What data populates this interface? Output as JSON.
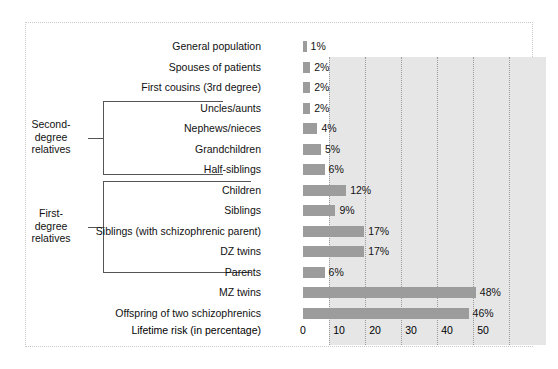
{
  "chart_data": {
    "type": "bar",
    "orientation": "horizontal",
    "title": "",
    "xlabel": "Lifetime risk (in percentage)",
    "ylabel": "",
    "xlim": [
      0,
      60
    ],
    "xticks": [
      "0",
      "10",
      "20",
      "30",
      "40",
      "50"
    ],
    "xtick_values": [
      0,
      10,
      20,
      30,
      40,
      50
    ],
    "grid": "vertical dotted gridlines",
    "legend": "none",
    "bar_color": "#9c9c9c",
    "plot_background": "#e6e6e6",
    "value_suffix": "%",
    "categories": [
      "General population",
      "Spouses of patients",
      "First cousins (3rd degree)",
      "Uncles/aunts",
      "Nephews/nieces",
      "Grandchildren",
      "Half-siblings",
      "Children",
      "Siblings",
      "Siblings (with schizophrenic parent)",
      "DZ twins",
      "Parents",
      "MZ twins",
      "Offspring of two schizophrenics"
    ],
    "values": [
      1,
      2,
      2,
      2,
      4,
      5,
      6,
      12,
      9,
      17,
      17,
      6,
      48,
      46
    ],
    "value_labels": [
      "1%",
      "2%",
      "2%",
      "2%",
      "4%",
      "5%",
      "6%",
      "12%",
      "9%",
      "17%",
      "17%",
      "6%",
      "48%",
      "46%"
    ]
  },
  "annotations": {
    "brackets": [
      {
        "id": "second-degree",
        "label_line1": "Second-",
        "label_line2": "degree",
        "label_line3": "relatives",
        "covers_from": "Uncles/aunts",
        "covers_to": "Half-siblings"
      },
      {
        "id": "first-degree",
        "label_line1": "First-",
        "label_line2": "degree",
        "label_line3": "relatives",
        "covers_from": "Children",
        "covers_to": "Parents"
      }
    ]
  }
}
